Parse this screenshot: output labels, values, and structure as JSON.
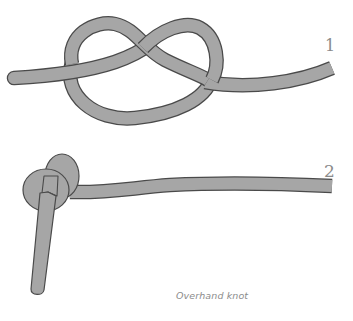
{
  "figure": {
    "steps": [
      {
        "number": "1",
        "description": "Rope laid out forming an open overhand loop"
      },
      {
        "number": "2",
        "description": "Rope pulled tight into a finished overhand knot"
      }
    ],
    "caption": "Overhand knot"
  },
  "colors": {
    "rope_fill": "#a6a6a6",
    "rope_outline": "#4a4a4a",
    "label_text": "#8a8a8a",
    "background": "#ffffff"
  }
}
